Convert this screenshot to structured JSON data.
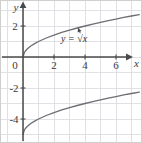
{
  "figure": {
    "background_color": "#ffffff",
    "border_color": "#cfcfcf",
    "grid_color": "#d8d8de",
    "axis_color": "#4a4a4a",
    "curve_color": "#6d6d73",
    "label_color": "#3a3a3a",
    "width": 142,
    "height": 143
  },
  "axes": {
    "x_name": "x",
    "y_name": "y",
    "x_ticks": [
      "2",
      "4",
      "6"
    ],
    "y_ticks": [
      "2",
      "-2",
      "-4"
    ],
    "origin_label": "0"
  },
  "annotation": {
    "curve_label": "y = √x",
    "leader": "arrow-to-upper-curve"
  },
  "chart_data": {
    "type": "line",
    "title": "",
    "xlabel": "x",
    "ylabel": "y",
    "xlim": [
      -1.5,
      7.7
    ],
    "ylim": [
      -5.6,
      3.7
    ],
    "grid": true,
    "grid_step": 1,
    "legend": "none",
    "xticks": [
      0,
      2,
      4,
      6
    ],
    "xticklabels": [
      "0",
      "2",
      "4",
      "6"
    ],
    "yticks": [
      2,
      0,
      -2,
      -4
    ],
    "yticklabels": [
      "2",
      "0",
      "-2",
      "-4"
    ],
    "annotations": [
      {
        "text": "y = √x",
        "x": 3.3,
        "y": 0.95,
        "points_to": {
          "x": 3.55,
          "y": 1.88
        }
      }
    ],
    "series": [
      {
        "name": "y = sqrt(x)",
        "equation": "y = √x",
        "labeled": true,
        "x": [
          0,
          0.1,
          0.25,
          0.5,
          0.75,
          1,
          1.5,
          2,
          2.5,
          3,
          3.5,
          4,
          4.5,
          5,
          5.5,
          6,
          6.5,
          7,
          7.5
        ],
        "y": [
          0,
          0.316,
          0.5,
          0.707,
          0.866,
          1,
          1.225,
          1.414,
          1.581,
          1.732,
          1.871,
          2,
          2.121,
          2.236,
          2.345,
          2.449,
          2.55,
          2.646,
          2.739
        ]
      },
      {
        "name": "y = sqrt(x) - 5",
        "equation": "y = √x − 5",
        "labeled": false,
        "x": [
          0,
          0.1,
          0.25,
          0.5,
          0.75,
          1,
          1.5,
          2,
          2.5,
          3,
          3.5,
          4,
          4.5,
          5,
          5.5,
          6,
          6.5,
          7,
          7.5
        ],
        "y": [
          -5,
          -4.684,
          -4.5,
          -4.293,
          -4.134,
          -4,
          -3.775,
          -3.586,
          -3.419,
          -3.268,
          -3.129,
          -3,
          -2.879,
          -2.764,
          -2.655,
          -2.551,
          -2.45,
          -2.354,
          -2.261
        ]
      }
    ]
  }
}
